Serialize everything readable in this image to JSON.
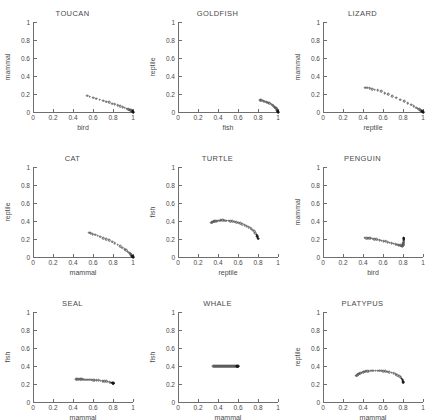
{
  "figure": {
    "layout": "3x3 grid of scatter panels",
    "axis_color": "#6e6e6e",
    "marker_color": "#555555",
    "background": "#ffffff"
  },
  "axes_common": {
    "xticks": [
      "0",
      "0.2",
      "0.4",
      "0.6",
      "0.8",
      "1"
    ],
    "yticks": [
      "0",
      "0.2",
      "0.4",
      "0.6",
      "0.8",
      "1"
    ],
    "xtick_values": [
      0,
      0.2,
      0.4,
      0.6,
      0.8,
      1
    ],
    "ytick_values": [
      0,
      0.2,
      0.4,
      0.6,
      0.8,
      1
    ],
    "xlim": [
      0,
      1
    ],
    "ylim": [
      0,
      1
    ],
    "grid": false,
    "legend": "none"
  },
  "chart_data": [
    {
      "type": "scatter",
      "title": "TOUCAN",
      "xlabel": "bird",
      "ylabel": "mammal",
      "xlim": [
        0,
        1
      ],
      "ylim": [
        0,
        1
      ],
      "x": [
        0.54,
        0.565,
        0.6,
        0.63,
        0.665,
        0.7,
        0.73,
        0.76,
        0.79,
        0.815,
        0.845,
        0.87,
        0.895,
        0.915,
        0.935,
        0.95,
        0.962,
        0.972,
        0.98,
        0.986,
        0.991,
        0.994,
        0.996,
        0.998,
        0.999,
        1.0
      ],
      "y": [
        0.182,
        0.17,
        0.158,
        0.15,
        0.138,
        0.126,
        0.116,
        0.106,
        0.094,
        0.085,
        0.074,
        0.064,
        0.054,
        0.046,
        0.038,
        0.031,
        0.026,
        0.021,
        0.017,
        0.013,
        0.01,
        0.008,
        0.006,
        0.004,
        0.002,
        0.0
      ]
    },
    {
      "type": "scatter",
      "title": "GOLDFISH",
      "xlabel": "fish",
      "ylabel": "reptile",
      "xlim": [
        0,
        1
      ],
      "ylim": [
        0,
        1
      ],
      "x": [
        0.82,
        0.832,
        0.845,
        0.858,
        0.872,
        0.886,
        0.9,
        0.913,
        0.926,
        0.938,
        0.949,
        0.959,
        0.967,
        0.974,
        0.98,
        0.985,
        0.989,
        0.992,
        0.994,
        0.996,
        0.997,
        0.998,
        0.999,
        1.0
      ],
      "y": [
        0.132,
        0.128,
        0.124,
        0.12,
        0.115,
        0.11,
        0.104,
        0.097,
        0.09,
        0.082,
        0.074,
        0.065,
        0.056,
        0.048,
        0.04,
        0.032,
        0.026,
        0.02,
        0.016,
        0.012,
        0.009,
        0.006,
        0.003,
        0.0
      ]
    },
    {
      "type": "scatter",
      "title": "LIZARD",
      "xlabel": "reptile",
      "ylabel": "mammal",
      "xlim": [
        0,
        1
      ],
      "ylim": [
        0,
        1
      ],
      "x": [
        0.42,
        0.44,
        0.465,
        0.49,
        0.518,
        0.548,
        0.58,
        0.615,
        0.65,
        0.69,
        0.73,
        0.77,
        0.81,
        0.848,
        0.88,
        0.908,
        0.93,
        0.948,
        0.962,
        0.973,
        0.982,
        0.988,
        0.993,
        0.996,
        0.998,
        1.0
      ],
      "y": [
        0.268,
        0.272,
        0.262,
        0.255,
        0.248,
        0.24,
        0.228,
        0.212,
        0.196,
        0.178,
        0.158,
        0.138,
        0.118,
        0.098,
        0.08,
        0.064,
        0.05,
        0.038,
        0.028,
        0.021,
        0.015,
        0.01,
        0.006,
        0.004,
        0.002,
        0.0
      ]
    },
    {
      "type": "scatter",
      "title": "CAT",
      "xlabel": "mammal",
      "ylabel": "reptile",
      "xlim": [
        0,
        1
      ],
      "ylim": [
        0,
        1
      ],
      "x": [
        0.56,
        0.578,
        0.598,
        0.62,
        0.645,
        0.672,
        0.7,
        0.73,
        0.76,
        0.79,
        0.818,
        0.845,
        0.87,
        0.894,
        0.915,
        0.933,
        0.948,
        0.96,
        0.97,
        0.978,
        0.984,
        0.989,
        0.993,
        0.996,
        0.998,
        1.0
      ],
      "y": [
        0.268,
        0.262,
        0.255,
        0.246,
        0.236,
        0.225,
        0.212,
        0.198,
        0.184,
        0.168,
        0.152,
        0.136,
        0.12,
        0.104,
        0.088,
        0.073,
        0.06,
        0.048,
        0.038,
        0.029,
        0.022,
        0.016,
        0.011,
        0.007,
        0.003,
        0.0
      ]
    },
    {
      "type": "scatter",
      "title": "TURTLE",
      "xlabel": "reptile",
      "ylabel": "fish",
      "xlim": [
        0,
        1
      ],
      "ylim": [
        0,
        1
      ],
      "x": [
        0.33,
        0.34,
        0.351,
        0.362,
        0.374,
        0.386,
        0.399,
        0.412,
        0.426,
        0.441,
        0.456,
        0.472,
        0.489,
        0.506,
        0.524,
        0.543,
        0.562,
        0.582,
        0.602,
        0.623,
        0.644,
        0.665,
        0.686,
        0.707,
        0.726,
        0.744,
        0.76,
        0.774,
        0.785,
        0.793,
        0.798,
        0.801
      ],
      "y": [
        0.38,
        0.386,
        0.391,
        0.395,
        0.398,
        0.401,
        0.403,
        0.405,
        0.406,
        0.406,
        0.406,
        0.405,
        0.404,
        0.402,
        0.399,
        0.396,
        0.392,
        0.387,
        0.381,
        0.374,
        0.366,
        0.356,
        0.345,
        0.332,
        0.318,
        0.302,
        0.285,
        0.266,
        0.247,
        0.23,
        0.214,
        0.202
      ]
    },
    {
      "type": "scatter",
      "title": "PENGUIN",
      "xlabel": "bird",
      "ylabel": "mammal",
      "xlim": [
        0,
        1
      ],
      "ylim": [
        0,
        1
      ],
      "x": [
        0.418,
        0.432,
        0.447,
        0.462,
        0.478,
        0.495,
        0.512,
        0.53,
        0.549,
        0.568,
        0.588,
        0.608,
        0.628,
        0.648,
        0.668,
        0.688,
        0.707,
        0.725,
        0.742,
        0.757,
        0.77,
        0.78,
        0.788,
        0.794,
        0.798,
        0.801,
        0.803,
        0.804,
        0.805,
        0.805,
        0.805,
        0.805,
        0.805,
        0.805,
        0.805,
        0.805
      ],
      "y": [
        0.213,
        0.212,
        0.21,
        0.208,
        0.206,
        0.203,
        0.2,
        0.196,
        0.192,
        0.188,
        0.183,
        0.178,
        0.173,
        0.167,
        0.161,
        0.155,
        0.149,
        0.143,
        0.138,
        0.133,
        0.129,
        0.126,
        0.124,
        0.123,
        0.125,
        0.132,
        0.142,
        0.152,
        0.162,
        0.172,
        0.181,
        0.189,
        0.196,
        0.202,
        0.207,
        0.211
      ]
    },
    {
      "type": "scatter",
      "title": "SEAL",
      "xlabel": "mammal",
      "ylabel": "fish",
      "xlim": [
        0,
        1
      ],
      "ylim": [
        0,
        1
      ],
      "x": [
        0.432,
        0.444,
        0.457,
        0.47,
        0.484,
        0.499,
        0.514,
        0.53,
        0.547,
        0.564,
        0.582,
        0.6,
        0.619,
        0.638,
        0.657,
        0.676,
        0.695,
        0.714,
        0.732,
        0.749,
        0.765,
        0.779,
        0.79,
        0.798,
        0.803,
        0.806
      ],
      "y": [
        0.252,
        0.252,
        0.252,
        0.252,
        0.251,
        0.251,
        0.25,
        0.249,
        0.248,
        0.247,
        0.246,
        0.245,
        0.243,
        0.241,
        0.239,
        0.237,
        0.234,
        0.231,
        0.228,
        0.224,
        0.22,
        0.216,
        0.213,
        0.21,
        0.208,
        0.207
      ]
    },
    {
      "type": "scatter",
      "title": "WHALE",
      "xlabel": "mammal",
      "ylabel": "fish",
      "xlim": [
        0,
        1
      ],
      "ylim": [
        0,
        1
      ],
      "x": [
        0.352,
        0.362,
        0.372,
        0.382,
        0.392,
        0.402,
        0.412,
        0.422,
        0.432,
        0.442,
        0.452,
        0.462,
        0.472,
        0.482,
        0.492,
        0.502,
        0.512,
        0.522,
        0.532,
        0.542,
        0.552,
        0.56,
        0.568,
        0.576,
        0.583,
        0.589,
        0.594,
        0.598,
        0.6
      ],
      "y": [
        0.4,
        0.4,
        0.4,
        0.4,
        0.4,
        0.4,
        0.4,
        0.4,
        0.4,
        0.4,
        0.4,
        0.4,
        0.4,
        0.4,
        0.4,
        0.4,
        0.4,
        0.4,
        0.4,
        0.4,
        0.4,
        0.4,
        0.4,
        0.4,
        0.4,
        0.4,
        0.4,
        0.4,
        0.4
      ]
    },
    {
      "type": "scatter",
      "title": "PLATYPUS",
      "xlabel": "mammal",
      "ylabel": "reptile",
      "xlim": [
        0,
        1
      ],
      "ylim": [
        0,
        1
      ],
      "x": [
        0.33,
        0.34,
        0.351,
        0.362,
        0.374,
        0.387,
        0.4,
        0.414,
        0.428,
        0.443,
        0.459,
        0.475,
        0.492,
        0.509,
        0.527,
        0.545,
        0.564,
        0.583,
        0.603,
        0.623,
        0.643,
        0.664,
        0.685,
        0.705,
        0.725,
        0.744,
        0.761,
        0.776,
        0.788,
        0.796,
        0.801,
        0.804
      ],
      "y": [
        0.29,
        0.299,
        0.307,
        0.314,
        0.32,
        0.326,
        0.331,
        0.335,
        0.339,
        0.342,
        0.345,
        0.347,
        0.348,
        0.349,
        0.349,
        0.349,
        0.348,
        0.346,
        0.343,
        0.34,
        0.336,
        0.331,
        0.325,
        0.318,
        0.309,
        0.299,
        0.287,
        0.273,
        0.258,
        0.242,
        0.227,
        0.213
      ]
    }
  ]
}
